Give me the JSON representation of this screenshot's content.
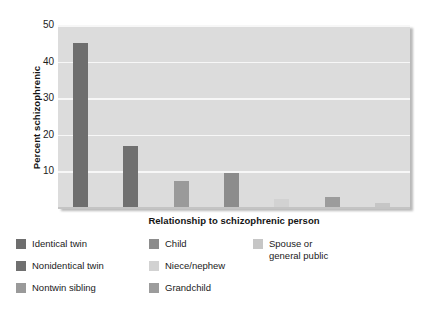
{
  "chart_data": {
    "type": "bar",
    "title": "",
    "subtitle": "",
    "xlabel": "Relationship to schizophrenic person",
    "ylabel": "Percent schizophrenic",
    "ylim": [
      0,
      50
    ],
    "yticks": [
      10,
      20,
      30,
      40,
      50
    ],
    "ytick_labels": [
      "10",
      "20",
      "30",
      "40",
      "50"
    ],
    "grid": true,
    "legend_position": "below",
    "categories": [
      "Identical twin",
      "Nonidentical twin",
      "Nontwin sibling",
      "Child",
      "Niece/nephew",
      "Grandchild",
      "Spouse or general public"
    ],
    "values": [
      45,
      17,
      7.5,
      9.5,
      2.5,
      3,
      1.5
    ],
    "bar_colors": [
      "#6e6e6e",
      "#707070",
      "#9a9a9a",
      "#8c8c8c",
      "#d2d2d2",
      "#9c9c9c",
      "#c6c6c6"
    ],
    "plot_background": "#dcdcdc",
    "gridline_color": "#f7f7f7"
  },
  "axes": {
    "y_title": "Percent schizophrenic",
    "x_title": "Relationship to schizophrenic person"
  },
  "legend": {
    "columns": [
      {
        "items": [
          {
            "label": "Identical twin",
            "color": "#6e6e6e"
          },
          {
            "label": "Nonidentical twin",
            "color": "#707070"
          },
          {
            "label": "Nontwin sibling",
            "color": "#9a9a9a"
          }
        ]
      },
      {
        "items": [
          {
            "label": "Child",
            "color": "#8c8c8c"
          },
          {
            "label": "Niece/nephew",
            "color": "#d2d2d2"
          },
          {
            "label": "Grandchild",
            "color": "#9c9c9c"
          }
        ]
      },
      {
        "items": [
          {
            "label": "Spouse or\ngeneral public",
            "color": "#c6c6c6"
          }
        ]
      }
    ]
  }
}
